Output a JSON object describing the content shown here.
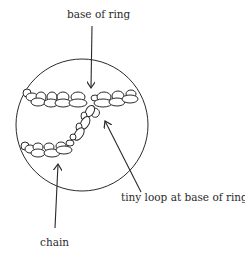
{
  "diagram": {
    "type": "crochet-technique-illustration",
    "labels": {
      "base_of_ring": "base of ring",
      "tiny_loop": "tiny loop at base of ring",
      "chain": "chain"
    },
    "colors": {
      "stroke": "#2a2a2a",
      "background": "#ffffff"
    }
  }
}
